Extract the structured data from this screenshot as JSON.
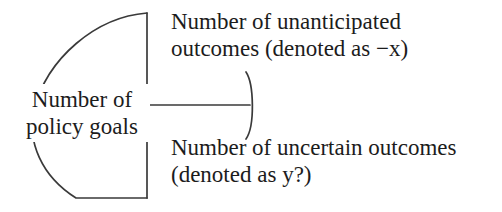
{
  "figure": {
    "type": "brace-diagram",
    "orientation": "right-facing-brace",
    "background_color": "#ffffff",
    "stroke_color": "#3a3a3a",
    "text_color": "#1c1c1c"
  },
  "brace": {
    "name": "right-facing-curly-brace",
    "spine_x": 147,
    "spine_top_y": 13,
    "spine_bottom_y": 198,
    "tick_y": 105,
    "tick_end_x": 252,
    "arc_bulge_direction": "left",
    "mid_arc_bulge_direction": "right"
  },
  "labels": {
    "group": {
      "line1": "Number of",
      "line2": "policy goals"
    },
    "branch_top": {
      "line1": "Number of unanticipated",
      "line2": "outcomes (denoted as −x)"
    },
    "branch_bottom": {
      "line1": "Number of uncertain outcomes",
      "line2": "(denoted as y?)"
    }
  }
}
